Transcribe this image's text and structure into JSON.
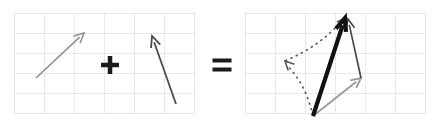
{
  "figure": {
    "canvas": {
      "width": 438,
      "height": 126,
      "background": "#ffffff"
    },
    "grid": {
      "cell_size": 30,
      "line_color": "#e9e9ec",
      "border_color": "#e4e4e8",
      "columns": 6,
      "rows": 5
    },
    "panels": [
      {
        "id": "panel-addend-a",
        "label": "first vector panel",
        "x": 14,
        "y": 13,
        "width": 180,
        "height": 100
      },
      {
        "id": "panel-addend-b",
        "label": "second vector panel",
        "x": 14,
        "y": 13,
        "width": 180,
        "height": 100
      },
      {
        "id": "panel-resultant",
        "label": "resultant vector panel",
        "x": 245,
        "y": 13,
        "width": 180,
        "height": 100
      }
    ],
    "operators": [
      {
        "id": "plus",
        "symbol": "+",
        "cx": 110,
        "cy": 65,
        "color": "#1b1b1b"
      },
      {
        "id": "equals",
        "symbol": "=",
        "cx": 222,
        "cy": 65,
        "color": "#1b1b1b"
      }
    ],
    "vectors": [
      {
        "id": "vector-a-left",
        "name": "vector a (light gray, up-right)",
        "x1": 36,
        "y1": 78,
        "x2": 84,
        "y2": 33,
        "color": "#909090",
        "width": 1.6,
        "head_len": 11,
        "head_angle": 26,
        "style": "solid"
      },
      {
        "id": "vector-b-middle",
        "name": "vector b (dark gray, up-left)",
        "x1": 176,
        "y1": 104,
        "x2": 152,
        "y2": 36,
        "color": "#4a4a4a",
        "width": 1.8,
        "head_len": 12,
        "head_angle": 24,
        "style": "solid"
      },
      {
        "id": "vector-a-result",
        "name": "vector a translated in result panel",
        "x1": 313,
        "y1": 116,
        "x2": 361,
        "y2": 78,
        "color": "#9a9a9a",
        "width": 1.8,
        "head_len": 11,
        "head_angle": 26,
        "style": "solid"
      },
      {
        "id": "vector-b-result",
        "name": "vector b head-to-tail in result panel",
        "x1": 361,
        "y1": 78,
        "x2": 348,
        "y2": 19,
        "color": "#4a4a4a",
        "width": 1.7,
        "head_len": 11,
        "head_angle": 24,
        "style": "solid"
      },
      {
        "id": "vector-a-dashed",
        "name": "dashed construction copy of vector a",
        "x1": 313,
        "y1": 116,
        "x2": 285,
        "y2": 61,
        "color": "#5a5a5a",
        "width": 1.6,
        "head_len": 10,
        "head_angle": 26,
        "style": "dashed"
      },
      {
        "id": "vector-b-dashed",
        "name": "dashed construction copy of vector b",
        "x1": 285,
        "y1": 61,
        "x2": 346,
        "y2": 18,
        "color": "#5a5a5a",
        "width": 1.6,
        "head_len": 10,
        "head_angle": 26,
        "style": "dashed"
      },
      {
        "id": "vector-resultant",
        "name": "resultant sum vector (thick black)",
        "x1": 313,
        "y1": 116,
        "x2": 345,
        "y2": 18,
        "color": "#111111",
        "width": 4.2,
        "head_len": 14,
        "head_angle": 22,
        "style": "solid"
      }
    ]
  }
}
